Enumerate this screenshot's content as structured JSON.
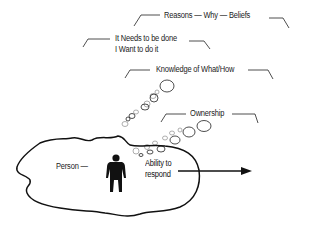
{
  "diagram": {
    "type": "concept-illustration",
    "labels": {
      "reasons": "Reasons — Why — Beliefs",
      "needs_line1": "It Needs to be done",
      "needs_line2": "I Want to do it",
      "knowledge": "Knowledge of What/How",
      "ownership": "Ownership",
      "person": "Person —",
      "ability_line1": "Ability to",
      "ability_line2": "respond"
    },
    "elements": {
      "blob": "person-boundary",
      "figure": "person-silhouette",
      "arrow": "response-arrow",
      "bubbles": "thought-bubbles"
    },
    "colors": {
      "stroke": "#111111",
      "text": "#222222",
      "bubble_faint": "#999999"
    }
  }
}
